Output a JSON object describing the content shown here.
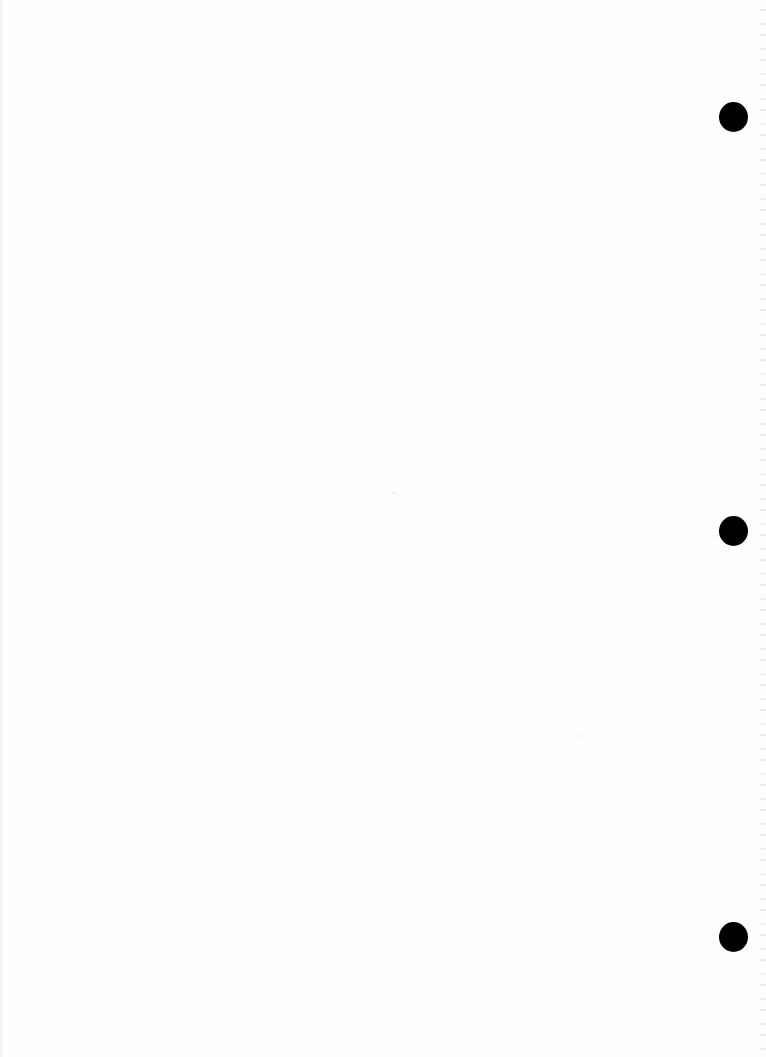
{
  "document": {
    "type": "scanned blank page",
    "text_content": "",
    "background_color": "#fefefe",
    "punch_holes": [
      {
        "name": "top",
        "cx": 733,
        "cy": 117,
        "diameter": 30,
        "color": "#000000"
      },
      {
        "name": "middle",
        "cx": 733,
        "cy": 531,
        "diameter": 30,
        "color": "#000000"
      },
      {
        "name": "bottom",
        "cx": 733,
        "cy": 937,
        "diameter": 30,
        "color": "#000000"
      }
    ]
  }
}
